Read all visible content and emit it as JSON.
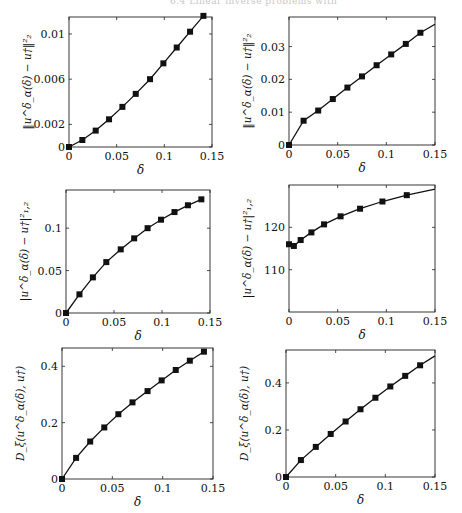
{
  "page": {
    "header_text": "6.4 Linear inverse problems with"
  },
  "chart_data": [
    {
      "id": "p1",
      "type": "line",
      "title": "",
      "xlabel": "δ",
      "ylabel": "‖u^δ_α(δ) − u†‖²₂",
      "xlim": [
        0,
        0.15
      ],
      "ylim": [
        0,
        0.0115
      ],
      "xticks": [
        0,
        0.05,
        0.1,
        0.15
      ],
      "xtick_labels": [
        "0",
        "0.05",
        "0.1",
        "0.15"
      ],
      "yticks": [
        0,
        0.002,
        0.006,
        0.01
      ],
      "ytick_labels": [
        "0",
        "0.002",
        "0.006",
        "0.01"
      ],
      "frame": {
        "left": 69,
        "top": 17,
        "right": 212,
        "bottom": 147
      },
      "x": [
        0,
        0.014,
        0.028,
        0.042,
        0.056,
        0.07,
        0.085,
        0.099,
        0.113,
        0.127,
        0.141
      ],
      "y": [
        0.0,
        0.00062,
        0.00145,
        0.00245,
        0.00355,
        0.0047,
        0.006,
        0.0074,
        0.0088,
        0.0102,
        0.0116
      ],
      "markers": "square"
    },
    {
      "id": "p2",
      "type": "line",
      "title": "",
      "xlabel": "δ",
      "ylabel": "‖u^δ_α(δ) − u†‖²₂",
      "xlim": [
        0,
        0.15
      ],
      "ylim": [
        0,
        0.039
      ],
      "xticks": [
        0,
        0.05,
        0.1,
        0.15
      ],
      "xtick_labels": [
        "0",
        "0.05",
        "0.1",
        "0.15"
      ],
      "yticks": [
        0,
        0.01,
        0.02,
        0.03
      ],
      "ytick_labels": [
        "0",
        "0.01",
        "0.02",
        "0.03"
      ],
      "frame": {
        "left": 289,
        "top": 17,
        "right": 435,
        "bottom": 145
      },
      "x": [
        0,
        0.015,
        0.03,
        0.045,
        0.06,
        0.075,
        0.09,
        0.105,
        0.12,
        0.135,
        0.15
      ],
      "y": [
        0.0,
        0.0074,
        0.0105,
        0.014,
        0.0175,
        0.0209,
        0.0243,
        0.0276,
        0.0308,
        0.0342,
        0.0368
      ],
      "markers": "square",
      "marker_count": 10
    },
    {
      "id": "p3",
      "type": "line",
      "title": "",
      "xlabel": "δ",
      "ylabel": "|u^δ_α(δ) − u†|²₁,₂",
      "xlim": [
        0,
        0.15
      ],
      "ylim": [
        0,
        0.145
      ],
      "xticks": [
        0,
        0.05,
        0.1,
        0.15
      ],
      "xtick_labels": [
        "0",
        "0.05",
        "0.1",
        "0.15"
      ],
      "yticks": [
        0,
        0.05,
        0.1
      ],
      "ytick_labels": [
        "0",
        "0.05",
        "0.1"
      ],
      "frame": {
        "left": 66,
        "top": 190,
        "right": 210,
        "bottom": 313
      },
      "x": [
        0,
        0.014,
        0.028,
        0.042,
        0.057,
        0.071,
        0.085,
        0.099,
        0.113,
        0.127,
        0.141
      ],
      "y": [
        0.0,
        0.022,
        0.042,
        0.06,
        0.075,
        0.088,
        0.1,
        0.11,
        0.119,
        0.127,
        0.134
      ],
      "markers": "square"
    },
    {
      "id": "p4",
      "type": "line",
      "title": "",
      "xlabel": "δ",
      "ylabel": "|u^δ_α(δ) − u†|²₁,₂",
      "xlim": [
        0,
        0.15
      ],
      "ylim": [
        100,
        130
      ],
      "xticks": [
        0,
        0.05,
        0.1,
        0.15
      ],
      "xtick_labels": [
        "0",
        "0.05",
        "0.1",
        "0.15"
      ],
      "yticks": [
        110,
        120
      ],
      "ytick_labels": [
        "110",
        "120"
      ],
      "frame": {
        "left": 289,
        "top": 185,
        "right": 435,
        "bottom": 312
      },
      "x": [
        0,
        0.005,
        0.012,
        0.023,
        0.036,
        0.053,
        0.073,
        0.096,
        0.121,
        0.15
      ],
      "y": [
        116.0,
        115.6,
        117.0,
        118.8,
        120.7,
        122.6,
        124.4,
        126.1,
        127.6,
        129.0
      ],
      "markers": "square",
      "marker_count": 9
    },
    {
      "id": "p5",
      "type": "line",
      "title": "",
      "xlabel": "δ",
      "ylabel": "D_ξ(u^δ_α(δ), u†)",
      "xlim": [
        0,
        0.15
      ],
      "ylim": [
        0,
        0.465
      ],
      "xticks": [
        0,
        0.05,
        0.1,
        0.15
      ],
      "xtick_labels": [
        "0",
        "0.05",
        "0.1",
        "0.15"
      ],
      "yticks": [
        0,
        0.2,
        0.4
      ],
      "ytick_labels": [
        "0",
        "0.2",
        "0.4"
      ],
      "frame": {
        "left": 62,
        "top": 348,
        "right": 213,
        "bottom": 479
      },
      "x": [
        0,
        0.014,
        0.028,
        0.042,
        0.056,
        0.07,
        0.085,
        0.099,
        0.113,
        0.127,
        0.141
      ],
      "y": [
        0.0,
        0.075,
        0.133,
        0.183,
        0.23,
        0.272,
        0.312,
        0.35,
        0.387,
        0.42,
        0.452
      ],
      "markers": "square"
    },
    {
      "id": "p6",
      "type": "line",
      "title": "",
      "xlabel": "δ",
      "ylabel": "D_ξ(u^δ_α(δ), u†)",
      "xlim": [
        0,
        0.15
      ],
      "ylim": [
        0,
        0.54
      ],
      "xticks": [
        0,
        0.05,
        0.1,
        0.15
      ],
      "xtick_labels": [
        "0",
        "0.05",
        "0.1",
        "0.15"
      ],
      "yticks": [
        0,
        0.2,
        0.4
      ],
      "ytick_labels": [
        "0",
        "0.2",
        "0.4"
      ],
      "frame": {
        "left": 286,
        "top": 350,
        "right": 435,
        "bottom": 477
      },
      "x": [
        0,
        0.015,
        0.03,
        0.045,
        0.06,
        0.075,
        0.09,
        0.105,
        0.12,
        0.135,
        0.15
      ],
      "y": [
        0.0,
        0.072,
        0.128,
        0.183,
        0.236,
        0.288,
        0.337,
        0.385,
        0.43,
        0.475,
        0.515
      ],
      "markers": "square",
      "marker_count": 10
    }
  ]
}
